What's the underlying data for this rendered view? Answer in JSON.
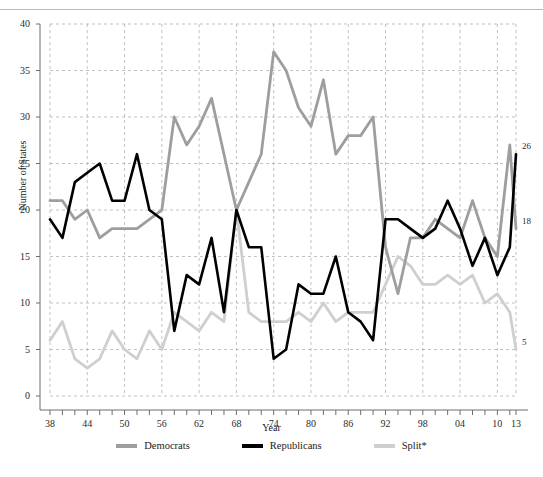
{
  "figure": {
    "top_rule": true,
    "partial_caption": ""
  },
  "legend": {
    "position": "bottom-center",
    "items": [
      {
        "label": "Democrats",
        "color": "#9e9e9e"
      },
      {
        "label": "Republicans",
        "color": "#000000"
      },
      {
        "label": "Split*",
        "color": "#cfcfcf"
      }
    ]
  },
  "end_labels": [
    {
      "series": "Republicans",
      "value": "26",
      "color": "#2b2b2b"
    },
    {
      "series": "Democrats",
      "value": "18",
      "color": "#2b2b2b"
    },
    {
      "series": "Split*",
      "value": "5",
      "color": "#2b2b2b"
    }
  ],
  "axes": {
    "y_ticks": [
      "0",
      "5",
      "10",
      "15",
      "20",
      "25",
      "30",
      "35",
      "40"
    ],
    "x_ticks": [
      "38",
      "44",
      "50",
      "56",
      "62",
      "68",
      "74",
      "80",
      "86",
      "92",
      "98",
      "04",
      "10",
      "13"
    ]
  },
  "chart_data": {
    "type": "line",
    "title": "",
    "xlabel": "Year",
    "ylabel": "Number of States",
    "xlim": [
      1938,
      2013
    ],
    "ylim": [
      0,
      40
    ],
    "ytick_values": [
      0,
      5,
      10,
      15,
      20,
      25,
      30,
      35,
      40
    ],
    "ytick_labels": [
      "0",
      "5",
      "10",
      "15",
      "20",
      "25",
      "30",
      "35",
      "40"
    ],
    "xtick_values": [
      1938,
      1944,
      1950,
      1956,
      1962,
      1968,
      1974,
      1980,
      1986,
      1992,
      1998,
      2004,
      2010,
      2013
    ],
    "xtick_labels": [
      "38",
      "44",
      "50",
      "56",
      "62",
      "68",
      "74",
      "80",
      "86",
      "92",
      "98",
      "04",
      "10",
      "13"
    ],
    "grid": true,
    "grid_style": "dashed",
    "legend_position": "bottom-center",
    "x": [
      1938,
      1940,
      1942,
      1944,
      1946,
      1948,
      1950,
      1952,
      1954,
      1956,
      1958,
      1960,
      1962,
      1964,
      1966,
      1968,
      1970,
      1972,
      1974,
      1976,
      1978,
      1980,
      1982,
      1984,
      1986,
      1988,
      1990,
      1992,
      1994,
      1996,
      1998,
      2000,
      2002,
      2004,
      2006,
      2008,
      2010,
      2012,
      2013
    ],
    "series": [
      {
        "name": "Democrats",
        "color": "#9e9e9e",
        "values": [
          21,
          21,
          19,
          20,
          17,
          18,
          18,
          18,
          19,
          20,
          30,
          27,
          29,
          32,
          26,
          20,
          23,
          26,
          37,
          35,
          31,
          29,
          34,
          26,
          28,
          28,
          30,
          16,
          11,
          17,
          17,
          19,
          18,
          17,
          21,
          17,
          15,
          27,
          18
        ]
      },
      {
        "name": "Republicans",
        "color": "#000000",
        "values": [
          19,
          17,
          23,
          24,
          25,
          21,
          21,
          26,
          20,
          19,
          7,
          13,
          12,
          17,
          9,
          20,
          16,
          16,
          4,
          5,
          12,
          11,
          11,
          15,
          9,
          8,
          6,
          19,
          19,
          18,
          17,
          18,
          21,
          18,
          14,
          17,
          13,
          16,
          26
        ]
      },
      {
        "name": "Split*",
        "color": "#cfcfcf",
        "values": [
          6,
          8,
          4,
          3,
          4,
          7,
          5,
          4,
          7,
          5,
          9,
          8,
          7,
          9,
          8,
          20,
          9,
          8,
          8,
          8,
          9,
          8,
          10,
          8,
          9,
          9,
          9,
          12,
          15,
          14,
          12,
          12,
          13,
          12,
          13,
          10,
          11,
          9,
          5
        ]
      }
    ]
  }
}
